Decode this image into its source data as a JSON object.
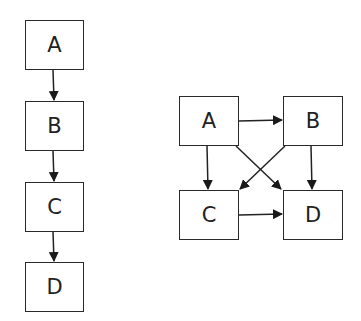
{
  "colors": {
    "stroke": "#222222",
    "background": "#ffffff"
  },
  "diagrams": [
    {
      "name": "linear-chain",
      "nodes": [
        {
          "id": "A",
          "label": "A",
          "x": 25,
          "y": 20,
          "w": 59,
          "h": 50
        },
        {
          "id": "B",
          "label": "B",
          "x": 25,
          "y": 101,
          "w": 59,
          "h": 50
        },
        {
          "id": "C",
          "label": "C",
          "x": 25,
          "y": 182,
          "w": 59,
          "h": 50
        },
        {
          "id": "D",
          "label": "D",
          "x": 25,
          "y": 262,
          "w": 59,
          "h": 50
        }
      ],
      "edges": [
        [
          "A",
          "B"
        ],
        [
          "B",
          "C"
        ],
        [
          "C",
          "D"
        ]
      ]
    },
    {
      "name": "fully-connected-dag",
      "nodes": [
        {
          "id": "A",
          "label": "A",
          "x": 179,
          "y": 96,
          "w": 60,
          "h": 50
        },
        {
          "id": "B",
          "label": "B",
          "x": 283,
          "y": 96,
          "w": 60,
          "h": 50
        },
        {
          "id": "C",
          "label": "C",
          "x": 179,
          "y": 190,
          "w": 60,
          "h": 50
        },
        {
          "id": "D",
          "label": "D",
          "x": 283,
          "y": 190,
          "w": 60,
          "h": 50
        }
      ],
      "edges": [
        [
          "A",
          "B"
        ],
        [
          "A",
          "C"
        ],
        [
          "A",
          "D"
        ],
        [
          "B",
          "C"
        ],
        [
          "B",
          "D"
        ],
        [
          "C",
          "D"
        ]
      ]
    }
  ]
}
